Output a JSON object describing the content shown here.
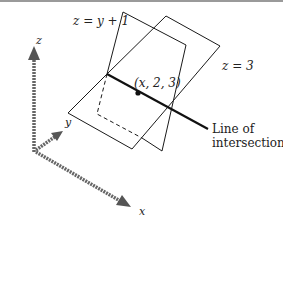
{
  "figure": {
    "labels": {
      "plane_a": "z = y + 1",
      "plane_b": "z = 3",
      "point": "(x, 2, 3)",
      "line_line1": "Line of",
      "line_line2": "intersection",
      "axis_x": "x",
      "axis_y": "y",
      "axis_z": "z"
    },
    "colors": {
      "ink": "#1a1a1a",
      "axis": "#555555",
      "rule": "#9a9a9a",
      "background": "#ffffff"
    }
  }
}
